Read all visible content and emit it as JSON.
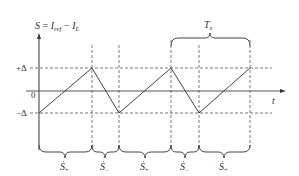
{
  "diagram": {
    "title_expression": {
      "lhs": "S",
      "eq": " = ",
      "i_ref": "I",
      "i_ref_sub": "ref",
      "minus": " − ",
      "i_l": "I",
      "i_l_sub": "L"
    },
    "y_labels": {
      "plus_delta": "+Δ",
      "zero": "0",
      "minus_delta": "−Δ"
    },
    "x_axis_label": "t",
    "period_label": {
      "main": "T",
      "sub": "s"
    },
    "segments": [
      {
        "label": "Ṡ",
        "sub": "+"
      },
      {
        "label": "Ṡ",
        "sub": "−"
      },
      {
        "label": "Ṡ",
        "sub": "+"
      },
      {
        "label": "Ṡ",
        "sub": "−"
      },
      {
        "label": "Ṡ",
        "sub": "+"
      }
    ],
    "waveform_points": [
      [
        39,
        113
      ],
      [
        92,
        68
      ],
      [
        119,
        113
      ],
      [
        171,
        68
      ],
      [
        199,
        113
      ],
      [
        250,
        68
      ]
    ],
    "colors": {
      "line": "#444444",
      "dashed": "#555555",
      "text": "#333333"
    }
  }
}
